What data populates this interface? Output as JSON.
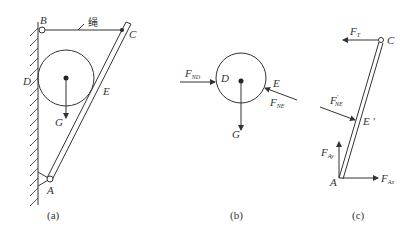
{
  "figure_a": {
    "caption": "(a)",
    "labels": {
      "B": "B",
      "C": "C",
      "D": "D",
      "E": "E",
      "G": "G",
      "A": "A",
      "rope": "绳"
    }
  },
  "figure_b": {
    "caption": "(b)",
    "labels": {
      "D": "D",
      "E": "E",
      "G": "G"
    },
    "forces": {
      "F_ND": {
        "main": "F",
        "sub": "ND"
      },
      "F_NE": {
        "main": "F",
        "sub": "NE"
      }
    }
  },
  "figure_c": {
    "caption": "(c)",
    "labels": {
      "C": "C",
      "E_prime": "E '",
      "A": "A"
    },
    "forces": {
      "F_T": {
        "main": "F",
        "sub": "T"
      },
      "F_NE_prime": {
        "main": "F",
        "sub": "NE",
        "sup": "'"
      },
      "F_Ay": {
        "main": "F",
        "sub": "Ay"
      },
      "F_Ax": {
        "main": "F",
        "sub": "Ax"
      }
    }
  }
}
